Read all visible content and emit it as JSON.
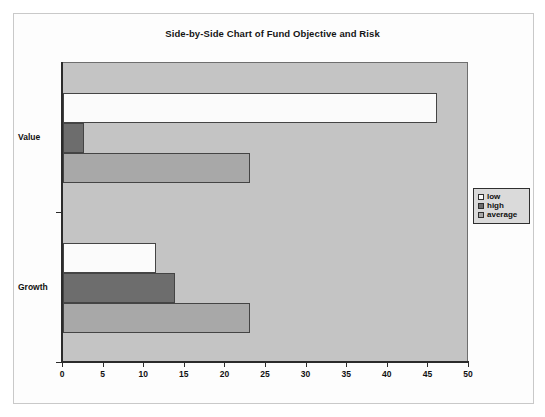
{
  "chart_data": {
    "type": "bar",
    "orientation": "horizontal",
    "title": "Side-by-Side Chart of Fund Objective and Risk",
    "xlabel": "",
    "ylabel": "",
    "categories": [
      "Value",
      "Growth"
    ],
    "series": [
      {
        "name": "low",
        "values": [
          46,
          11.5
        ]
      },
      {
        "name": "high",
        "values": [
          2.6,
          13.8
        ]
      },
      {
        "name": "average",
        "values": [
          23,
          23
        ]
      }
    ],
    "xlim": [
      0,
      50
    ],
    "xticks": [
      0,
      5,
      10,
      15,
      20,
      25,
      30,
      35,
      40,
      45,
      50
    ],
    "grid": false,
    "legend_position": "right",
    "colors": {
      "low": "#fbfbfb",
      "high": "#6d6d6d",
      "average": "#a8a8a8",
      "plot_background": "#c4c4c4",
      "legend_background": "#dadada",
      "axis": "#2b2b2b"
    }
  },
  "legend": {
    "items": [
      {
        "label": "low"
      },
      {
        "label": "high"
      },
      {
        "label": "average"
      }
    ]
  }
}
